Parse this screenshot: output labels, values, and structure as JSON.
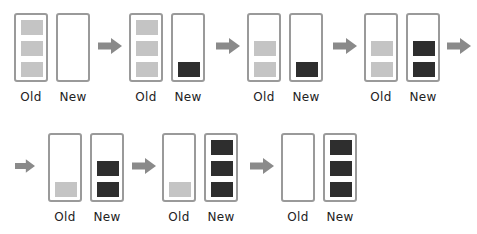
{
  "diagram": {
    "type": "state-sequence",
    "colors": {
      "border": "#9a9a9a",
      "old_item": "#c4c4c4",
      "new_item": "#2e2e2e",
      "arrow": "#8a8a8a"
    },
    "labels": {
      "old": "Old",
      "new": "New"
    },
    "steps": [
      {
        "old_slots": [
          1,
          1,
          1
        ],
        "new_slots": [
          0,
          0,
          0
        ]
      },
      {
        "old_slots": [
          1,
          1,
          1
        ],
        "new_slots": [
          0,
          0,
          1
        ]
      },
      {
        "old_slots": [
          0,
          1,
          1
        ],
        "new_slots": [
          0,
          0,
          1
        ]
      },
      {
        "old_slots": [
          0,
          1,
          1
        ],
        "new_slots": [
          0,
          1,
          1
        ]
      },
      {
        "old_slots": [
          0,
          0,
          1
        ],
        "new_slots": [
          0,
          1,
          1
        ]
      },
      {
        "old_slots": [
          0,
          0,
          1
        ],
        "new_slots": [
          1,
          1,
          1
        ]
      },
      {
        "old_slots": [
          0,
          0,
          0
        ],
        "new_slots": [
          1,
          1,
          1
        ]
      }
    ]
  },
  "step_labels": [
    {
      "old": "Old",
      "new": "New"
    },
    {
      "old": "Old",
      "new": "New"
    },
    {
      "old": "Old",
      "new": "New"
    },
    {
      "old": "Old",
      "new": "New"
    },
    {
      "old": "Old",
      "new": "New"
    },
    {
      "old": "Old",
      "new": "New"
    },
    {
      "old": "Old",
      "new": "New"
    }
  ]
}
